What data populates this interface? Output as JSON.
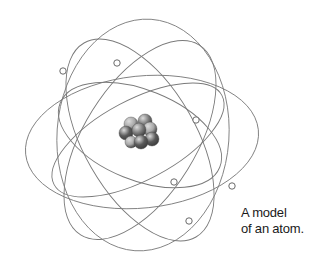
{
  "figure": {
    "title": "A model of an atom",
    "caption_lines": [
      "A model",
      "of an atom."
    ]
  },
  "colors": {
    "orbit": "#7a7a7a",
    "electron_stroke": "#6a6a6a",
    "electron_fill": "#ffffff",
    "nucleus_dark": "#5a5a5a",
    "nucleus_mid": "#7c7c7c",
    "nucleus_light": "#a8a8a8",
    "caption": "#1a1a1a"
  },
  "nucleus": {
    "center": [
      138,
      132
    ],
    "particles": [
      {
        "x": 131,
        "y": 124,
        "r": 7,
        "shade": "light"
      },
      {
        "x": 145,
        "y": 121,
        "r": 7,
        "shade": "mid"
      },
      {
        "x": 150,
        "y": 129,
        "r": 7,
        "shade": "light"
      },
      {
        "x": 126,
        "y": 133,
        "r": 7,
        "shade": "dark"
      },
      {
        "x": 139,
        "y": 130,
        "r": 7,
        "shade": "mid"
      },
      {
        "x": 152,
        "y": 139,
        "r": 7,
        "shade": "dark"
      },
      {
        "x": 131,
        "y": 142,
        "r": 6,
        "shade": "light"
      },
      {
        "x": 141,
        "y": 142,
        "r": 7,
        "shade": "dark"
      }
    ]
  },
  "orbits": [
    {
      "name": "horizontal-wide",
      "cx": 142,
      "cy": 142,
      "rx": 117,
      "ry": 66,
      "rotate": -6
    },
    {
      "name": "tilted-left-tall",
      "cx": 140,
      "cy": 140,
      "rx": 56,
      "ry": 112,
      "rotate": -30
    },
    {
      "name": "tilted-right-tall",
      "cx": 140,
      "cy": 140,
      "rx": 56,
      "ry": 112,
      "rotate": 32
    },
    {
      "name": "upright-tall",
      "cx": 143,
      "cy": 135,
      "rx": 86,
      "ry": 116,
      "rotate": 4
    },
    {
      "name": "inner-tilted",
      "cx": 140,
      "cy": 135,
      "rx": 86,
      "ry": 45,
      "rotate": 22
    },
    {
      "name": "inner-tilted-b",
      "cx": 138,
      "cy": 140,
      "rx": 95,
      "ry": 40,
      "rotate": -28
    }
  ],
  "electrons": [
    {
      "x": 63,
      "y": 71
    },
    {
      "x": 117,
      "y": 63
    },
    {
      "x": 196,
      "y": 120
    },
    {
      "x": 174,
      "y": 182
    },
    {
      "x": 232,
      "y": 186
    },
    {
      "x": 189,
      "y": 221
    }
  ]
}
